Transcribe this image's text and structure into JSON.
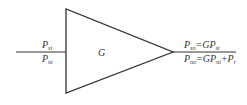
{
  "diagram": {
    "block_label": "G",
    "input": {
      "top": {
        "base": "P",
        "sub": "si"
      },
      "bottom": {
        "base": "P",
        "sub": "ni"
      }
    },
    "output": {
      "top": {
        "base": "P",
        "sub": "so",
        "eq": "=GP",
        "eq_sub": "si",
        "tail": "",
        "tail_sub": ""
      },
      "bottom": {
        "base": "P",
        "sub": "no",
        "eq": "=GP",
        "eq_sub": "ni",
        "tail": "+P",
        "tail_sub": "r"
      }
    },
    "colors": {
      "stroke": "#333333",
      "background": "#ffffff"
    }
  }
}
